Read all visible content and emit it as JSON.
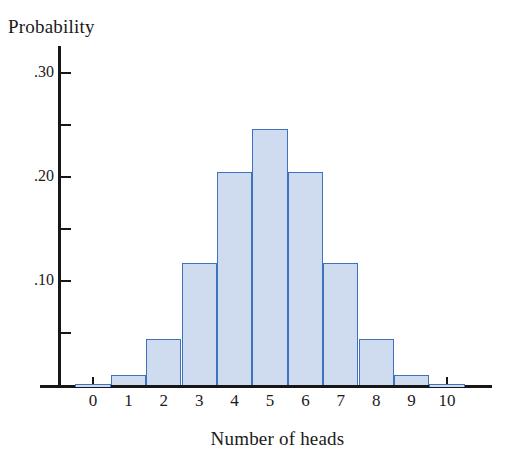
{
  "chart_data": {
    "type": "bar",
    "title": "",
    "xlabel": "Number of heads",
    "ylabel": "Probability",
    "categories": [
      "0",
      "1",
      "2",
      "3",
      "4",
      "5",
      "6",
      "7",
      "8",
      "9",
      "10"
    ],
    "values": [
      0.001,
      0.01,
      0.044,
      0.117,
      0.205,
      0.246,
      0.205,
      0.117,
      0.044,
      0.01,
      0.001
    ],
    "ylim": [
      0,
      0.325
    ],
    "xlim": [
      -0.5,
      10.5
    ],
    "grid": false,
    "legend": null,
    "y_major_ticks": [
      0.1,
      0.2,
      0.3
    ],
    "y_major_tick_labels": [
      ".10",
      ".20",
      ".30"
    ],
    "y_minor_ticks": [
      0.05,
      0.15,
      0.25
    ],
    "bar_fill_color": "#cfdcef",
    "bar_edge_color": "#3f72bc",
    "axis_color": "#171717",
    "background_color": "#ffffff",
    "distribution": "binomial n=10 p=0.5"
  }
}
